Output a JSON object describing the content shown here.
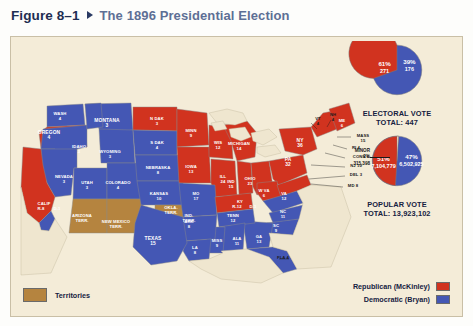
{
  "caption": {
    "figure_number": "Figure 8–1",
    "title": "The 1896 Presidential Election"
  },
  "colors": {
    "republican": "#d1331f",
    "democrat": "#4457b4",
    "territory": "#b5843f",
    "background": "#f4ecd8",
    "water": "#efe6cf",
    "caption_number": "#1e2d52",
    "caption_title": "#5d6f95"
  },
  "legend": {
    "territories_label": "Territories",
    "parties": [
      {
        "label": "Republican (McKinley)",
        "color": "#d1331f"
      },
      {
        "label": "Democratic (Bryan)",
        "color": "#4457b4"
      }
    ]
  },
  "stats": {
    "electoral": {
      "caption_line1": "ELECTORAL VOTE",
      "caption_line2": "TOTAL: 447",
      "rep_pct": "61%",
      "rep_value": "271",
      "dem_pct": "39%",
      "dem_value": "176"
    },
    "popular": {
      "caption_line1": "POPULAR VOTE",
      "caption_line2": "TOTAL: 13,923,102",
      "rep_pct": "51%",
      "rep_value": "7,104,779",
      "dem_pct": "47%",
      "dem_value": "6,502,925",
      "minor_label": "MINOR",
      "minor_pct": "2%",
      "minor_value": "315,398"
    }
  },
  "chart_data": [
    {
      "type": "pie",
      "title": "ELECTORAL VOTE TOTAL: 447",
      "labels": [
        "Republican (McKinley)",
        "Democratic (Bryan)"
      ],
      "values": [
        271,
        176
      ],
      "percents": [
        61,
        39
      ],
      "colors": [
        "#d1331f",
        "#4457b4"
      ],
      "total": 447
    },
    {
      "type": "pie",
      "title": "POPULAR VOTE TOTAL: 13,923,102",
      "labels": [
        "Republican (McKinley)",
        "Democratic (Bryan)",
        "Minor"
      ],
      "values": [
        7104779,
        6502925,
        315398
      ],
      "percents": [
        51,
        47,
        2
      ],
      "colors": [
        "#d1331f",
        "#4457b4",
        "#f4ecd8"
      ],
      "total": 13923102
    },
    {
      "type": "map",
      "title": "The 1896 Presidential Election",
      "categories": [
        "WASH",
        "OREGON",
        "CALIF",
        "NEVADA",
        "IDAHO",
        "MONTANA",
        "WYOMING",
        "UTAH",
        "COLORADO",
        "N DAK",
        "S DAK",
        "NEBRASKA",
        "KANSAS",
        "MINN",
        "IOWA",
        "WIS",
        "ILL",
        "MICHIGAN",
        "MO",
        "ARK",
        "LA",
        "TEXAS",
        "MISS",
        "ALA",
        "TENN",
        "KY",
        "IND",
        "OHIO",
        "W VA",
        "VA",
        "NC",
        "SC",
        "GA",
        "FLA",
        "PA",
        "NY",
        "NJ",
        "DEL",
        "MD",
        "CONN",
        "RI",
        "MASS",
        "VT",
        "NH",
        "ME"
      ],
      "values": [
        4,
        4,
        9,
        3,
        3,
        3,
        3,
        3,
        4,
        3,
        4,
        8,
        10,
        9,
        13,
        12,
        24,
        14,
        17,
        8,
        8,
        15,
        9,
        11,
        12,
        13,
        15,
        23,
        6,
        12,
        11,
        9,
        13,
        4,
        32,
        36,
        10,
        3,
        8,
        6,
        4,
        15,
        4,
        4,
        6
      ],
      "winners": [
        "R",
        "R",
        "split",
        "D",
        "D",
        "D",
        "D",
        "D",
        "D",
        "R",
        "D",
        "D",
        "D",
        "R",
        "R",
        "R",
        "R",
        "R",
        "D",
        "D",
        "D",
        "D",
        "D",
        "D",
        "D",
        "split",
        "R",
        "R",
        "R",
        "D",
        "D",
        "D",
        "D",
        "D",
        "R",
        "R",
        "R",
        "R",
        "R",
        "R",
        "R",
        "R",
        "R",
        "R",
        "R"
      ]
    }
  ],
  "map": {
    "states": [
      {
        "name": "WASH",
        "votes": "4",
        "party": "D",
        "x": 49,
        "y": 78,
        "size": "t4"
      },
      {
        "name": "OREGON",
        "votes": "4",
        "party": "R",
        "x": 38,
        "y": 97,
        "size": "t5"
      },
      {
        "name": "MONTANA",
        "votes": "3",
        "party": "D",
        "x": 96,
        "y": 85,
        "size": "t5"
      },
      {
        "name": "IDAHO",
        "votes": "3",
        "party": "D",
        "x": 68,
        "y": 111,
        "size": "t4"
      },
      {
        "name": "WYOMING",
        "votes": "3",
        "party": "D",
        "x": 99,
        "y": 116,
        "size": "t4"
      },
      {
        "name": "NEVADA",
        "votes": "3",
        "party": "D",
        "x": 53,
        "y": 141,
        "size": "t4"
      },
      {
        "name": "UTAH",
        "votes": "3",
        "party": "D",
        "x": 76,
        "y": 147,
        "size": "t4"
      },
      {
        "name": "COLORADO",
        "votes": "4",
        "party": "D",
        "x": 107,
        "y": 147,
        "size": "t4"
      },
      {
        "name": "N DAK",
        "votes": "3",
        "party": "R",
        "x": 146,
        "y": 83,
        "size": "t4"
      },
      {
        "name": "S DAK",
        "votes": "4",
        "party": "D",
        "x": 146,
        "y": 107,
        "size": "t4"
      },
      {
        "name": "NEBRASKA",
        "votes": "8",
        "party": "D",
        "x": 147,
        "y": 132,
        "size": "t4"
      },
      {
        "name": "KANSAS",
        "votes": "10",
        "party": "D",
        "x": 148,
        "y": 158,
        "size": "t4"
      },
      {
        "name": "MINN",
        "votes": "9",
        "party": "R",
        "x": 180,
        "y": 95,
        "size": "t4"
      },
      {
        "name": "IOWA",
        "votes": "13",
        "party": "R",
        "x": 180,
        "y": 131,
        "size": "t4"
      },
      {
        "name": "WIS",
        "votes": "12",
        "party": "R",
        "x": 207,
        "y": 107,
        "size": "t4"
      },
      {
        "name": "MO",
        "votes": "17",
        "party": "D",
        "x": 185,
        "y": 158,
        "size": "t4"
      },
      {
        "name": "ILL",
        "votes": "24",
        "party": "R",
        "x": 212,
        "y": 141,
        "size": "t4"
      },
      {
        "name": "ARK",
        "votes": "8",
        "party": "D",
        "x": 178,
        "y": 186,
        "size": "t4"
      },
      {
        "name": "LA",
        "votes": "8",
        "party": "D",
        "x": 184,
        "y": 212,
        "size": "t4"
      },
      {
        "name": "TEXAS",
        "votes": "15",
        "party": "D",
        "x": 142,
        "y": 203,
        "size": "t5"
      },
      {
        "name": "MISS",
        "votes": "9",
        "party": "D",
        "x": 206,
        "y": 205,
        "size": "t4"
      },
      {
        "name": "ALA",
        "votes": "11",
        "party": "D",
        "x": 226,
        "y": 203,
        "size": "t4"
      },
      {
        "name": "TENN",
        "votes": "12",
        "party": "D",
        "x": 222,
        "y": 180,
        "size": "t4"
      },
      {
        "name": "GA",
        "votes": "13",
        "party": "D",
        "x": 248,
        "y": 201,
        "size": "t4"
      },
      {
        "name": "SC",
        "votes": "9",
        "party": "D",
        "x": 265,
        "y": 190,
        "size": "t4"
      },
      {
        "name": "NC",
        "votes": "11",
        "party": "D",
        "x": 272,
        "y": 176,
        "size": "t4"
      },
      {
        "name": "VA",
        "votes": "12",
        "party": "D",
        "x": 273,
        "y": 158,
        "size": "t4"
      },
      {
        "name": "W VA",
        "votes": "6",
        "party": "R",
        "x": 253,
        "y": 155,
        "size": "t4"
      },
      {
        "name": "OHIO",
        "votes": "23",
        "party": "R",
        "x": 239,
        "y": 143,
        "size": "t4"
      },
      {
        "name": "IND",
        "votes": "15",
        "party": "R",
        "x": 220,
        "y": 146,
        "size": "t4"
      },
      {
        "name": "MICHIGAN",
        "votes": "14",
        "party": "R",
        "x": 228,
        "y": 108,
        "size": "t4"
      },
      {
        "name": "PA",
        "votes": "32",
        "party": "R",
        "x": 277,
        "y": 124,
        "size": "t5"
      },
      {
        "name": "NY",
        "votes": "36",
        "party": "R",
        "x": 289,
        "y": 105,
        "size": "t5"
      },
      {
        "name": "ME",
        "votes": "6",
        "party": "R",
        "x": 331,
        "y": 85,
        "size": "t4"
      }
    ],
    "split_states": [
      {
        "name": "CALIF",
        "rep": "R-8",
        "dem": "D-1",
        "x": 33,
        "y": 168
      },
      {
        "name": "KY",
        "rep": "R-12",
        "dem": "D-1",
        "x": 229,
        "y": 166
      }
    ],
    "territories": [
      {
        "name": "ARIZONA",
        "sub": "TERR.",
        "x": 71,
        "y": 180
      },
      {
        "name": "NEW MEXICO",
        "sub": "TERR.",
        "x": 105,
        "y": 186
      },
      {
        "name": "OKLA.",
        "sub": "TERR.",
        "x": 160,
        "y": 172
      },
      {
        "name": "IND.",
        "sub": "TERR.",
        "x": 178,
        "y": 180
      }
    ],
    "leader_labels": [
      {
        "text": "VT",
        "sub": "4",
        "x": 307,
        "y": 83
      },
      {
        "text": "NH",
        "sub": "4",
        "x": 322,
        "y": 79
      },
      {
        "text": "MASS",
        "sub": "15",
        "x": 352,
        "y": 100
      },
      {
        "text": "RI 4",
        "sub": "",
        "x": 345,
        "y": 112
      },
      {
        "text": "CONN 6",
        "sub": "",
        "x": 350,
        "y": 121
      },
      {
        "text": "NJ 10",
        "sub": "",
        "x": 345,
        "y": 130
      },
      {
        "text": "DEL 3",
        "sub": "",
        "x": 345,
        "y": 139
      },
      {
        "text": "MD 8",
        "sub": "",
        "x": 342,
        "y": 150
      },
      {
        "text": "FLA 4",
        "sub": "",
        "x": 272,
        "y": 222
      }
    ]
  }
}
